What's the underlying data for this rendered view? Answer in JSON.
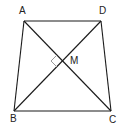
{
  "figure": {
    "type": "trapezoid-with-diagonals",
    "points": {
      "A": {
        "x": 24,
        "y": 21
      },
      "D": {
        "x": 101,
        "y": 21
      },
      "B": {
        "x": 14,
        "y": 111
      },
      "C": {
        "x": 111,
        "y": 111
      },
      "M": {
        "x": 63,
        "y": 61
      }
    },
    "labels": {
      "A": "A",
      "D": "D",
      "B": "B",
      "C": "C",
      "M": "M"
    },
    "right_angle_at": "M",
    "colors": {
      "line": "#1a1a1a",
      "marker": "#9a9a9a",
      "text": "#222222"
    }
  }
}
